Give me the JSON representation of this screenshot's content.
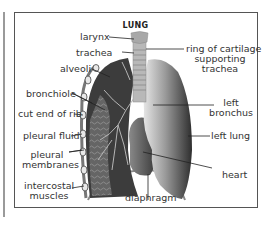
{
  "diagram": {
    "title": "LUNG",
    "labels": {
      "larynx": "larynx",
      "trachea": "trachea",
      "alveoli": "alveoli",
      "bronchiole": "bronchiole",
      "cut_end_of_rib": "cut end of rib",
      "pleural_fluid": "pleural fluid",
      "pleural_membranes_1": "pleural",
      "pleural_membranes_2": "membranes",
      "intercostal_muscles_1": "intercostal",
      "intercostal_muscles_2": "muscles",
      "ring_of_cartilage_1": "ring of cartilage",
      "ring_of_cartilage_2": "supporting",
      "ring_of_cartilage_3": "trachea",
      "left_bronchus_1": "left",
      "left_bronchus_2": "bronchus",
      "left_lung": "left lung",
      "heart": "heart",
      "diaphragm": "diaphragm"
    },
    "colors": {
      "frame": "#555555",
      "lung_dark": "#3a3a3a",
      "lung_light": "#d8d8d8",
      "text": "#333333"
    }
  }
}
